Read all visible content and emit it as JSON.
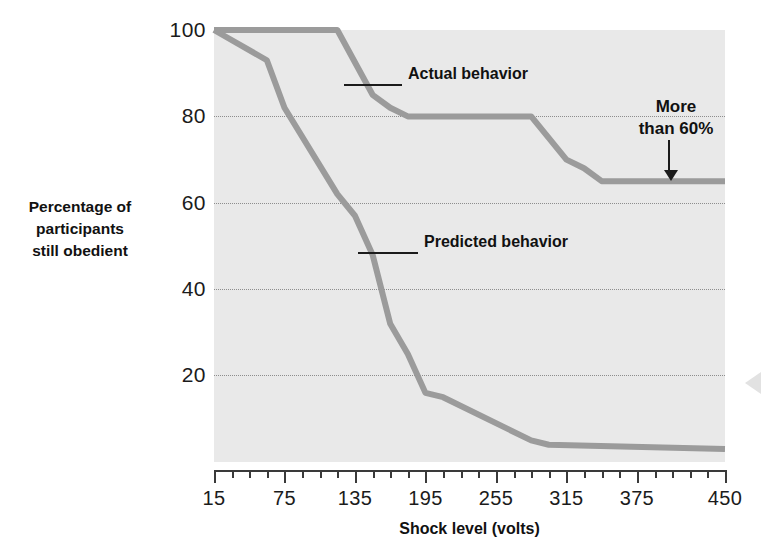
{
  "chart_data": {
    "type": "line",
    "title": "",
    "xlabel": "Shock level (volts)",
    "ylabel": "Percentage of participants still obedient",
    "xlim": [
      15,
      450
    ],
    "ylim": [
      0,
      100
    ],
    "grid": true,
    "legend_position": "inline-annotations",
    "x_tick_labels": [
      "15",
      "75",
      "135",
      "195",
      "255",
      "315",
      "375",
      "450"
    ],
    "x_tick_values": [
      15,
      75,
      135,
      195,
      255,
      315,
      375,
      450
    ],
    "y_tick_labels": [
      "100",
      "80",
      "60",
      "40",
      "20"
    ],
    "y_tick_values": [
      100,
      80,
      60,
      40,
      20
    ],
    "series": [
      {
        "name": "Actual behavior",
        "color": "#9b9b9b",
        "points": [
          {
            "x": 15,
            "y": 100
          },
          {
            "x": 120,
            "y": 100
          },
          {
            "x": 150,
            "y": 85
          },
          {
            "x": 165,
            "y": 82
          },
          {
            "x": 180,
            "y": 80
          },
          {
            "x": 285,
            "y": 80
          },
          {
            "x": 315,
            "y": 70
          },
          {
            "x": 330,
            "y": 68
          },
          {
            "x": 345,
            "y": 65
          },
          {
            "x": 450,
            "y": 65
          }
        ]
      },
      {
        "name": "Predicted behavior",
        "color": "#9b9b9b",
        "points": [
          {
            "x": 15,
            "y": 100
          },
          {
            "x": 60,
            "y": 93
          },
          {
            "x": 75,
            "y": 82
          },
          {
            "x": 120,
            "y": 62
          },
          {
            "x": 135,
            "y": 57
          },
          {
            "x": 150,
            "y": 48
          },
          {
            "x": 165,
            "y": 32
          },
          {
            "x": 180,
            "y": 25
          },
          {
            "x": 195,
            "y": 16
          },
          {
            "x": 210,
            "y": 15
          },
          {
            "x": 285,
            "y": 5
          },
          {
            "x": 300,
            "y": 4
          },
          {
            "x": 450,
            "y": 3
          }
        ]
      }
    ],
    "annotations": [
      {
        "name": "actual-behavior-label",
        "text": "Actual behavior"
      },
      {
        "name": "predicted-behavior-label",
        "text": "Predicted behavior"
      },
      {
        "name": "more-than-60-callout",
        "text": "More\nthan 60%"
      }
    ]
  },
  "axes": {
    "y_title_line1": "Percentage of",
    "y_title_line2": "participants",
    "y_title_line3": "still obedient",
    "x_title": "Shock level (volts)",
    "y_ticks": [
      {
        "label": "100",
        "value": 100
      },
      {
        "label": "80",
        "value": 80
      },
      {
        "label": "60",
        "value": 60
      },
      {
        "label": "40",
        "value": 40
      },
      {
        "label": "20",
        "value": 20
      }
    ],
    "x_ticks": [
      {
        "label": "15",
        "value": 15
      },
      {
        "label": "75",
        "value": 75
      },
      {
        "label": "135",
        "value": 135
      },
      {
        "label": "195",
        "value": 195
      },
      {
        "label": "255",
        "value": 255
      },
      {
        "label": "315",
        "value": 315
      },
      {
        "label": "375",
        "value": 375
      },
      {
        "label": "450",
        "value": 450
      }
    ]
  },
  "labels": {
    "actual": "Actual behavior",
    "predicted": "Predicted behavior",
    "callout_line1": "More",
    "callout_line2": "than 60%"
  },
  "colors": {
    "series_line": "#9b9b9b",
    "plot_background": "#e9e9e9",
    "gridline": "#8d8d8d",
    "axis": "#3a3a3a",
    "text": "#1b1b1b"
  }
}
